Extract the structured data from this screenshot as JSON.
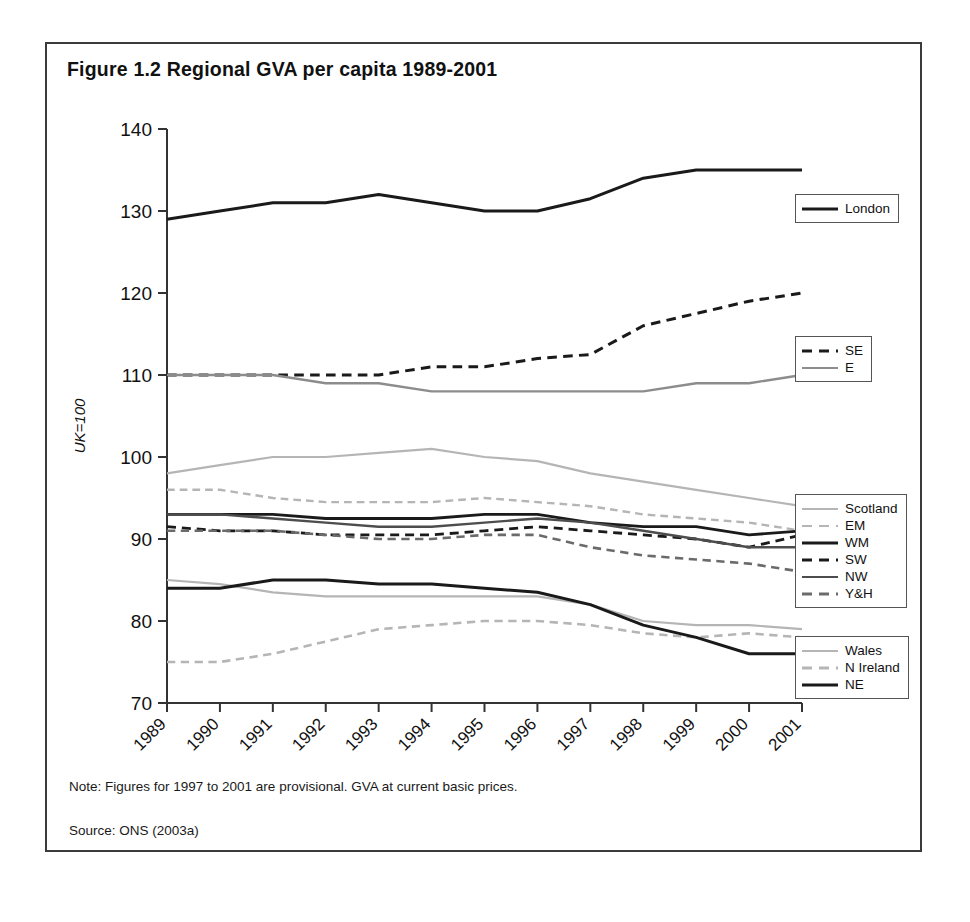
{
  "figure": {
    "title": "Figure 1.2 Regional GVA per capita 1989-2001",
    "note": "Note: Figures for 1997 to 2001 are provisional. GVA at current basic prices.",
    "source": "Source: ONS (2003a)"
  },
  "legends": {
    "london": {
      "title": "london-legend",
      "items": [
        "London"
      ]
    },
    "se_e": {
      "title": "se-e-legend",
      "items": [
        "SE",
        "E"
      ]
    },
    "mid": {
      "title": "mid-legend",
      "items": [
        "Scotland",
        "EM",
        "WM",
        "SW",
        "NW",
        "Y&H"
      ]
    },
    "bottom": {
      "title": "bottom-legend",
      "items": [
        "Wales",
        "N Ireland",
        "NE"
      ]
    }
  },
  "chart_data": {
    "type": "line",
    "title": "Figure 1.2 Regional GVA per capita 1989-2001",
    "xlabel": "",
    "ylabel": "UK=100",
    "categories": [
      "1989",
      "1990",
      "1991",
      "1992",
      "1993",
      "1994",
      "1995",
      "1996",
      "1997",
      "1998",
      "1999",
      "2000",
      "2001"
    ],
    "x": [
      1989,
      1990,
      1991,
      1992,
      1993,
      1994,
      1995,
      1996,
      1997,
      1998,
      1999,
      2000,
      2001
    ],
    "ylim": [
      70,
      140
    ],
    "yticks": [
      70,
      80,
      90,
      100,
      110,
      120,
      130,
      140
    ],
    "grid": false,
    "legend_position": "right",
    "series": [
      {
        "name": "London",
        "style": "solid",
        "color": "#1a1a1a",
        "width": 3.0,
        "values": [
          129,
          130,
          131,
          131,
          132,
          131,
          130,
          130,
          131.5,
          134,
          135,
          135,
          135
        ]
      },
      {
        "name": "SE",
        "style": "dashed",
        "color": "#1a1a1a",
        "width": 3.0,
        "values": [
          110,
          110,
          110,
          110,
          110,
          111,
          111,
          112,
          112.5,
          116,
          117.5,
          119,
          120
        ]
      },
      {
        "name": "E",
        "style": "solid",
        "color": "#8c8c8c",
        "width": 2.4,
        "values": [
          110,
          110,
          110,
          109,
          109,
          108,
          108,
          108,
          108,
          108,
          109,
          109,
          110
        ]
      },
      {
        "name": "Scotland",
        "style": "solid",
        "color": "#b5b5b5",
        "width": 2.2,
        "values": [
          98,
          99,
          100,
          100,
          100.5,
          101,
          100,
          99.5,
          98,
          97,
          96,
          95,
          94
        ]
      },
      {
        "name": "EM",
        "style": "dashed",
        "color": "#b5b5b5",
        "width": 2.4,
        "values": [
          96,
          96,
          95,
          94.5,
          94.5,
          94.5,
          95,
          94.5,
          94,
          93,
          92.5,
          92,
          91
        ]
      },
      {
        "name": "WM",
        "style": "solid",
        "color": "#1a1a1a",
        "width": 2.8,
        "values": [
          93,
          93,
          93,
          92.5,
          92.5,
          92.5,
          93,
          93,
          92,
          91.5,
          91.5,
          90.5,
          91
        ]
      },
      {
        "name": "SW",
        "style": "dashed",
        "color": "#1a1a1a",
        "width": 2.8,
        "values": [
          91.5,
          91,
          91,
          90.5,
          90.5,
          90.5,
          91,
          91.5,
          91,
          90.5,
          90,
          89,
          90.5
        ]
      },
      {
        "name": "NW",
        "style": "solid",
        "color": "#4d4d4d",
        "width": 2.4,
        "values": [
          93,
          93,
          92.5,
          92,
          91.5,
          91.5,
          92,
          92.5,
          92,
          91,
          90,
          89,
          89
        ]
      },
      {
        "name": "Y&H",
        "style": "dashed",
        "color": "#6b6b6b",
        "width": 2.6,
        "values": [
          91,
          91,
          91,
          90.5,
          90,
          90,
          90.5,
          90.5,
          89,
          88,
          87.5,
          87,
          86
        ]
      },
      {
        "name": "Wales",
        "style": "solid",
        "color": "#b5b5b5",
        "width": 2.2,
        "values": [
          85,
          84.5,
          83.5,
          83,
          83,
          83,
          83,
          83,
          82,
          80,
          79.5,
          79.5,
          79
        ]
      },
      {
        "name": "N Ireland",
        "style": "dashed",
        "color": "#b5b5b5",
        "width": 2.6,
        "values": [
          75,
          75,
          76,
          77.5,
          79,
          79.5,
          80,
          80,
          79.5,
          78.5,
          78,
          78.5,
          78
        ]
      },
      {
        "name": "NE",
        "style": "solid",
        "color": "#1a1a1a",
        "width": 3.0,
        "values": [
          84,
          84,
          85,
          85,
          84.5,
          84.5,
          84,
          83.5,
          82,
          79.5,
          78,
          76,
          76
        ]
      }
    ]
  }
}
